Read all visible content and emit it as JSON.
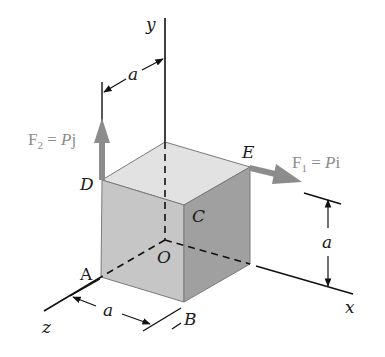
{
  "figure": {
    "type": "statics-cube-diagram"
  },
  "axes": {
    "x": "x",
    "y": "y",
    "z": "z",
    "origin": "O"
  },
  "vertices": {
    "A": "A",
    "B": "B",
    "C": "C",
    "D": "D",
    "E": "E",
    "O": "O"
  },
  "dimensions": {
    "top": "a",
    "right": "a",
    "bottom": "a"
  },
  "forces": [
    {
      "name": "F",
      "subscript": "2",
      "equals": " = ",
      "magnitude": "P",
      "unit_vector": "j",
      "applied_at": "D",
      "direction": "+y"
    },
    {
      "name": "F",
      "subscript": "1",
      "equals": " = ",
      "magnitude": "P",
      "unit_vector": "i",
      "applied_at": "E",
      "direction": "+x"
    }
  ],
  "colors": {
    "front_face": "#c6c6c6",
    "right_face": "#a0a0a0",
    "top_face": "#e2e2e2",
    "edge": "#7a7a7a",
    "force_arrow": "#8c8c8c",
    "force_label": "#8c8c8c",
    "line": "#111111"
  }
}
